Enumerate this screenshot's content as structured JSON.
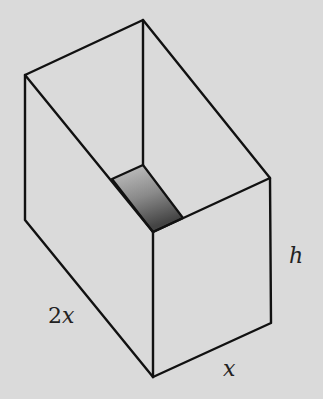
{
  "diagram": {
    "background_color": "#dadada",
    "line_color": "#111111",
    "shade_gradient": {
      "from": "#c4c4c4",
      "to": "#4a4a4a"
    },
    "labels": {
      "height": "h",
      "length_coeff": "2",
      "length_var": "x",
      "width": "x"
    },
    "dimensions": [
      {
        "edge": "length",
        "label": "2x"
      },
      {
        "edge": "width",
        "label": "x"
      },
      {
        "edge": "height",
        "label": "h"
      }
    ]
  }
}
